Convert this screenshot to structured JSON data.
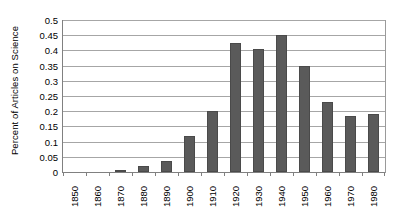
{
  "chart_data": {
    "type": "bar",
    "title": "",
    "xlabel": "",
    "ylabel": "Percent of Articles on Science",
    "categories": [
      "1850",
      "1860",
      "1870",
      "1880",
      "1890",
      "1900",
      "1910",
      "1920",
      "1930",
      "1940",
      "1950",
      "1960",
      "1970",
      "1980"
    ],
    "values": [
      0,
      0,
      0.007,
      0.021,
      0.037,
      0.12,
      0.2,
      0.425,
      0.405,
      0.45,
      0.35,
      0.23,
      0.185,
      0.19
    ],
    "ylim": [
      0,
      0.5
    ],
    "ytick_labels": [
      "0",
      "0.05",
      "0.1",
      "0.15",
      "0.2",
      "0.25",
      "0.3",
      "0.35",
      "0.4",
      "0.45",
      "0.5"
    ],
    "ytick_values": [
      0,
      0.05,
      0.1,
      0.15,
      0.2,
      0.25,
      0.3,
      0.35,
      0.4,
      0.45,
      0.5
    ],
    "grid": true,
    "legend": false,
    "bar_color": "#5a5a5a",
    "gridline_color": "#a6a6a6",
    "axis_color": "#808080",
    "background_color": "#ffffff",
    "xtick_label_rotation": -90
  }
}
